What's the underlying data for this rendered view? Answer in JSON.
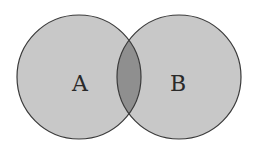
{
  "diagram": {
    "type": "venn",
    "sets": [
      {
        "label": "A",
        "cx": 79,
        "cy": 77,
        "r": 62,
        "fill": "#c8c8c8"
      },
      {
        "label": "B",
        "cx": 179,
        "cy": 77,
        "r": 62,
        "fill": "#c8c8c8"
      }
    ],
    "intersection": {
      "fill": "#8f8f8f",
      "label": ""
    },
    "stroke": "#3a3a3a",
    "background": "#ffffff"
  }
}
